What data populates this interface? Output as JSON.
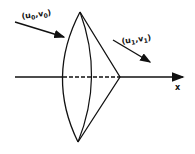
{
  "diagram": {
    "labels": {
      "incoming_vector": "(u0, v0)",
      "incoming_main": "(u",
      "incoming_sub0": "0",
      "incoming_sep": ",v",
      "incoming_sub1": "0",
      "incoming_close": ")",
      "outgoing_main": "(u",
      "outgoing_sub0": "1",
      "outgoing_sep": ",v",
      "outgoing_sub1": "1",
      "outgoing_close": ")",
      "axis": "x"
    },
    "colors": {
      "stroke": "#111111",
      "background": "#ffffff"
    }
  }
}
